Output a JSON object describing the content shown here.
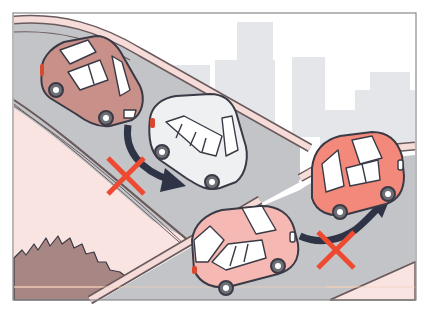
{
  "illustration": {
    "title": "Wrong way out of a parking area — do not cut across",
    "colors": {
      "sky": "#ffffff",
      "buildings": "#e4e6e9",
      "road": "#c2c4c7",
      "curb_pink": "#f6dcd9",
      "curb_line": "#6b5a5c",
      "sidewalk": "#f9e4e2",
      "hedge": "#a88684",
      "arrow": "#2f3346",
      "cross": "#ee4a32",
      "car_brown": "#c99089",
      "car_white": "#eef0f2",
      "car_coral": "#f2897a",
      "car_pink": "#f5b8b3",
      "window": "#ffffff",
      "tire": "#6d6f74",
      "hub": "#ffffff",
      "taillight": "#d8492f"
    },
    "cars": [
      {
        "name": "brown-car",
        "color_key": "car_brown"
      },
      {
        "name": "white-car",
        "color_key": "car_white"
      },
      {
        "name": "coral-car",
        "color_key": "car_coral"
      },
      {
        "name": "pink-car",
        "color_key": "car_pink"
      }
    ],
    "markers": [
      {
        "name": "prohibited-cross-left",
        "meaning": "Not allowed"
      },
      {
        "name": "prohibited-cross-right",
        "meaning": "Not allowed"
      }
    ]
  }
}
